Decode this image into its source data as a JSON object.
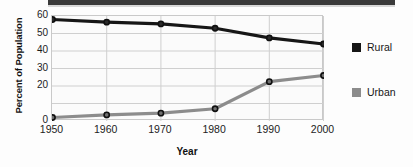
{
  "banner": {
    "present": true,
    "color": "#3a3a3a",
    "note": ""
  },
  "chart_data": {
    "type": "line",
    "title": "",
    "xlabel": "Year",
    "ylabel": "Percent of Population",
    "categories": [
      "1950",
      "1960",
      "1970",
      "1980",
      "1990",
      "2000"
    ],
    "x": [
      1950,
      1960,
      1970,
      1980,
      1990,
      2000
    ],
    "xlim": [
      1950,
      2000
    ],
    "ylim": [
      0,
      60
    ],
    "yticks": [
      0,
      20,
      30,
      40,
      50,
      60
    ],
    "ytick_labels": [
      "0",
      "20",
      "30",
      "40",
      "50",
      "60"
    ],
    "grid": true,
    "legend_position": "right",
    "series": [
      {
        "name": "Rural",
        "color": "#161616",
        "marker": "circle",
        "values": [
          58,
          56.5,
          55.5,
          53,
          47.5,
          44
        ]
      },
      {
        "name": "Urban",
        "color": "#8c8c8c",
        "marker": "circle",
        "values": [
          2,
          3.5,
          4.5,
          7,
          22.5,
          26
        ]
      }
    ]
  },
  "axis": {
    "y_title": "Percent of Population",
    "x_title": "Year"
  },
  "legend": {
    "items": [
      {
        "label": "Rural",
        "color": "#161616"
      },
      {
        "label": "Urban",
        "color": "#8c8c8c"
      }
    ]
  }
}
